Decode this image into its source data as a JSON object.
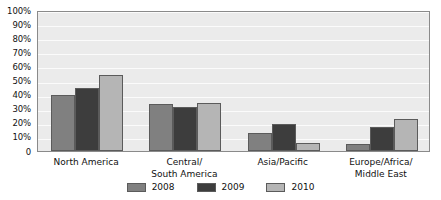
{
  "chart_data": {
    "type": "bar",
    "title": "",
    "xlabel": "",
    "ylabel": "",
    "ylim": [
      0,
      100
    ],
    "grid": true,
    "legend_position": "bottom",
    "categories": [
      "North America",
      "Central/\nSouth America",
      "Asia/Pacific",
      "Europe/Africa/\nMiddle East"
    ],
    "category_lines": [
      [
        "North America"
      ],
      [
        "Central/",
        "South America"
      ],
      [
        "Asia/Pacific"
      ],
      [
        "Europe/Africa/",
        "Middle East"
      ]
    ],
    "series": [
      {
        "name": "2008",
        "color": "#808080",
        "values": [
          40,
          33,
          13,
          5
        ]
      },
      {
        "name": "2009",
        "color": "#3d3d3d",
        "values": [
          45,
          31,
          19,
          17
        ]
      },
      {
        "name": "2010",
        "color": "#b5b5b5",
        "values": [
          54,
          34,
          6,
          23
        ]
      }
    ],
    "ytick_labels": [
      "100%",
      "90%",
      "80%",
      "70%",
      "60%",
      "50%",
      "40%",
      "30%",
      "20%",
      "10%",
      "0"
    ],
    "ytick_values": [
      100,
      90,
      80,
      70,
      60,
      50,
      40,
      30,
      20,
      10,
      0
    ],
    "colors": {
      "plot_background": "#ebebeb",
      "plot_border": "#8a8a8a",
      "gridline": "#fbfbfb",
      "bar_outline": "#5b5b5b",
      "text": "#111111",
      "page_background": "#ffffff"
    }
  }
}
